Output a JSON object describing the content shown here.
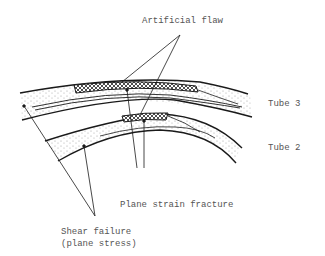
{
  "diagram": {
    "labels": {
      "artificial_flaw": "Artificial flaw",
      "tube3": "Tube 3",
      "tube2": "Tube 2",
      "plane_strain": "Plane strain fracture",
      "shear_failure_line1": "Shear failure",
      "shear_failure_line2": "(plane stress)"
    },
    "colors": {
      "line": "#1a1a1a",
      "text": "#555555",
      "stipple": "#8a8a8a"
    }
  }
}
